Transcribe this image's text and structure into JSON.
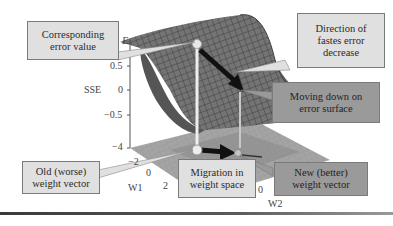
{
  "callouts": {
    "corresponding_error": {
      "line1": "Corresponding",
      "line2": "error value"
    },
    "direction_fastest": {
      "line1": "Direction of",
      "line2": "fastes error",
      "line3": "decrease"
    },
    "moving_down": {
      "line1": "Moving down on",
      "line2": "error surface"
    },
    "old_weight": {
      "line1": "Old (worse)",
      "line2": "weight vector"
    },
    "migration": {
      "line1": "Migration in",
      "line2": "weight space"
    },
    "new_weight": {
      "line1": "New (better)",
      "line2": "weight vector"
    }
  },
  "axes": {
    "z_title": "SSE",
    "z_symbol": "E",
    "z_ticks": [
      "0.5",
      "0",
      "−0.5",
      "−4"
    ],
    "w1_title": "W1",
    "w1_ticks": [
      "−2",
      "0",
      "2"
    ],
    "w2_title": "W2",
    "w2_ticks": [
      "0"
    ]
  },
  "colors": {
    "surface": "#6f6f6f",
    "surface_grid": "#4a4a4a",
    "callout_light": "#e0e0e0",
    "callout_dark": "#9a9a9a",
    "arrow": "#111111",
    "marker": "#e8e8e8"
  }
}
